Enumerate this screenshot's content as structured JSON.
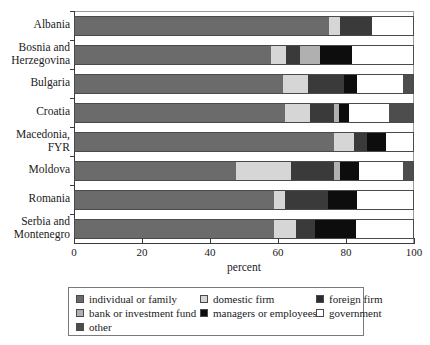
{
  "chart_data": {
    "type": "bar",
    "orientation": "horizontal",
    "stacked": true,
    "title": "",
    "xlabel": "percent",
    "ylabel": "",
    "xlim": [
      0,
      100
    ],
    "xticks": [
      0,
      20,
      40,
      60,
      80,
      100
    ],
    "xticklabels": [
      "0",
      "20",
      "40",
      "60",
      "80",
      "100"
    ],
    "grid": false,
    "legend_position": "bottom",
    "categories": [
      "Albania",
      "Bosnia and Herzegovina",
      "Bulgaria",
      "Croatia",
      "Macedonia, FYR",
      "Moldova",
      "Romania",
      "Serbia and Montenegro"
    ],
    "category_lines": [
      [
        "Albania"
      ],
      [
        "Bosnia and",
        "Herzegovina"
      ],
      [
        "Bulgaria"
      ],
      [
        "Croatia"
      ],
      [
        "Macedonia,",
        "FYR"
      ],
      [
        "Moldova"
      ],
      [
        "Romania"
      ],
      [
        "Serbia and",
        "Montenegro"
      ]
    ],
    "series": [
      {
        "name": "individual or family",
        "color": "#6b6b6b",
        "values": [
          75.0,
          58.0,
          61.5,
          62.0,
          76.5,
          47.5,
          59.0,
          59.0
        ]
      },
      {
        "name": "domestic firm",
        "color": "#d6d6d6",
        "values": [
          3.5,
          4.5,
          7.5,
          7.5,
          6.0,
          16.5,
          3.0,
          6.5
        ]
      },
      {
        "name": "foreign firm",
        "color": "#3a3a3a",
        "values": [
          9.5,
          4.0,
          10.5,
          7.0,
          4.0,
          12.5,
          13.0,
          5.5
        ]
      },
      {
        "name": "bank or investment fund",
        "color": "#b0b0b0",
        "values": [
          0,
          6.0,
          0,
          1.5,
          0,
          2.0,
          0,
          0
        ]
      },
      {
        "name": "managers or employees",
        "color": "#0d0d0d",
        "values": [
          0,
          9.5,
          4.0,
          3.0,
          5.5,
          5.5,
          8.5,
          12.0
        ]
      },
      {
        "name": "government",
        "color": "#ffffff",
        "values": [
          12.0,
          18.0,
          13.5,
          12.0,
          8.0,
          13.0,
          16.5,
          17.0
        ]
      },
      {
        "name": "other",
        "color": "#4d4d4d",
        "values": [
          0,
          0,
          3.0,
          7.0,
          0,
          3.0,
          0,
          0
        ]
      }
    ],
    "bars": [
      {
        "category": "Albania",
        "segments": [
          {
            "series": "individual or family",
            "start": 0,
            "end": 75
          },
          {
            "series": "domestic firm",
            "start": 75,
            "end": 78.5
          },
          {
            "series": "foreign firm",
            "start": 78.5,
            "end": 88
          },
          {
            "series": "government",
            "start": 88,
            "end": 100
          }
        ]
      },
      {
        "category": "Bosnia and Herzegovina",
        "segments": [
          {
            "series": "individual or family",
            "start": 0,
            "end": 58
          },
          {
            "series": "domestic firm",
            "start": 58,
            "end": 62.5
          },
          {
            "series": "foreign firm",
            "start": 62.5,
            "end": 66.5
          },
          {
            "series": "bank or investment fund",
            "start": 66.5,
            "end": 72.5
          },
          {
            "series": "managers or employees",
            "start": 72.5,
            "end": 82
          },
          {
            "series": "government",
            "start": 82,
            "end": 100
          }
        ]
      },
      {
        "category": "Bulgaria",
        "segments": [
          {
            "series": "individual or family",
            "start": 0,
            "end": 61.5
          },
          {
            "series": "domestic firm",
            "start": 61.5,
            "end": 69
          },
          {
            "series": "foreign firm",
            "start": 69,
            "end": 79.5
          },
          {
            "series": "managers or employees",
            "start": 79.5,
            "end": 83.5
          },
          {
            "series": "government",
            "start": 83.5,
            "end": 97
          },
          {
            "series": "other",
            "start": 97,
            "end": 100
          }
        ]
      },
      {
        "category": "Croatia",
        "segments": [
          {
            "series": "individual or family",
            "start": 0,
            "end": 62
          },
          {
            "series": "domestic firm",
            "start": 62,
            "end": 69.5
          },
          {
            "series": "foreign firm",
            "start": 69.5,
            "end": 76.5
          },
          {
            "series": "bank or investment fund",
            "start": 76.5,
            "end": 78
          },
          {
            "series": "managers or employees",
            "start": 78,
            "end": 81
          },
          {
            "series": "government",
            "start": 81,
            "end": 93
          },
          {
            "series": "other",
            "start": 93,
            "end": 100
          }
        ]
      },
      {
        "category": "Macedonia, FYR",
        "segments": [
          {
            "series": "individual or family",
            "start": 0,
            "end": 76.5
          },
          {
            "series": "domestic firm",
            "start": 76.5,
            "end": 82.5
          },
          {
            "series": "foreign firm",
            "start": 82.5,
            "end": 86.5
          },
          {
            "series": "managers or employees",
            "start": 86.5,
            "end": 92
          },
          {
            "series": "government",
            "start": 92,
            "end": 100
          }
        ]
      },
      {
        "category": "Moldova",
        "segments": [
          {
            "series": "individual or family",
            "start": 0,
            "end": 47.5
          },
          {
            "series": "domestic firm",
            "start": 47.5,
            "end": 64
          },
          {
            "series": "foreign firm",
            "start": 64,
            "end": 76.5
          },
          {
            "series": "bank or investment fund",
            "start": 76.5,
            "end": 78.5
          },
          {
            "series": "managers or employees",
            "start": 78.5,
            "end": 84
          },
          {
            "series": "government",
            "start": 84,
            "end": 97
          },
          {
            "series": "other",
            "start": 97,
            "end": 100
          }
        ]
      },
      {
        "category": "Romania",
        "segments": [
          {
            "series": "individual or family",
            "start": 0,
            "end": 59
          },
          {
            "series": "domestic firm",
            "start": 59,
            "end": 62
          },
          {
            "series": "foreign firm",
            "start": 62,
            "end": 75
          },
          {
            "series": "managers or employees",
            "start": 75,
            "end": 83.5
          },
          {
            "series": "government",
            "start": 83.5,
            "end": 100
          }
        ]
      },
      {
        "category": "Serbia and Montenegro",
        "segments": [
          {
            "series": "individual or family",
            "start": 0,
            "end": 59
          },
          {
            "series": "domestic firm",
            "start": 59,
            "end": 65.5
          },
          {
            "series": "foreign firm",
            "start": 65.5,
            "end": 71
          },
          {
            "series": "managers or employees",
            "start": 71,
            "end": 83
          },
          {
            "series": "government",
            "start": 83,
            "end": 100
          }
        ]
      }
    ],
    "legend": {
      "entries": [
        {
          "label": "individual or family",
          "color": "#6b6b6b"
        },
        {
          "label": "domestic firm",
          "color": "#d6d6d6"
        },
        {
          "label": "foreign firm",
          "color": "#2b2b2b"
        },
        {
          "label": "bank or investment fund",
          "color": "#b0b0b0"
        },
        {
          "label": "managers or employees",
          "color": "#0d0d0d"
        },
        {
          "label": "government",
          "color": "#ffffff"
        },
        {
          "label": "other",
          "color": "#4d4d4d"
        }
      ]
    }
  }
}
